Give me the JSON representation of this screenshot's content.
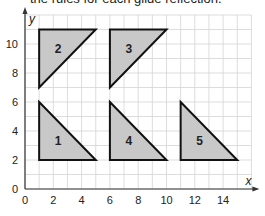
{
  "caption": "the rules for each glide reflection.",
  "chart_data": {
    "type": "scatter",
    "title": "",
    "xlabel": "x",
    "ylabel": "y",
    "xlim": [
      0,
      16
    ],
    "ylim": [
      0,
      12
    ],
    "grid": true,
    "x_ticks": [
      "0",
      "2",
      "4",
      "6",
      "8",
      "10",
      "12",
      "14"
    ],
    "y_ticks": [
      "0",
      "2",
      "4",
      "6",
      "8",
      "10"
    ],
    "shapes": [
      {
        "label": "1",
        "vertices": [
          [
            1,
            2
          ],
          [
            1,
            6
          ],
          [
            5,
            2
          ]
        ]
      },
      {
        "label": "2",
        "vertices": [
          [
            1,
            11
          ],
          [
            1,
            7
          ],
          [
            5,
            11
          ]
        ]
      },
      {
        "label": "3",
        "vertices": [
          [
            6,
            11
          ],
          [
            6,
            7
          ],
          [
            10,
            11
          ]
        ]
      },
      {
        "label": "4",
        "vertices": [
          [
            6,
            2
          ],
          [
            6,
            6
          ],
          [
            10,
            2
          ]
        ]
      },
      {
        "label": "5",
        "vertices": [
          [
            11,
            2
          ],
          [
            11,
            6
          ],
          [
            15,
            2
          ]
        ]
      }
    ],
    "fill_color": "#c8c8c8",
    "stroke_color": "#111111"
  }
}
